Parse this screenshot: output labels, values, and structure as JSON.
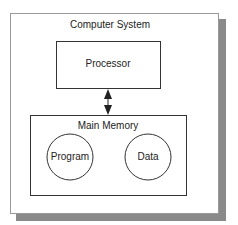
{
  "diagram": {
    "outer": {
      "label": "Computer System"
    },
    "processor": {
      "label": "Processor"
    },
    "memory": {
      "label": "Main Memory",
      "items": [
        {
          "label": "Program"
        },
        {
          "label": "Data"
        }
      ]
    },
    "connector": {
      "type": "bidirectional-arrow",
      "from": "Processor",
      "to": "Main Memory"
    },
    "colors": {
      "shadow": "#8a8a8a",
      "frame": "#9a9a9a",
      "stroke": "#333333"
    }
  }
}
